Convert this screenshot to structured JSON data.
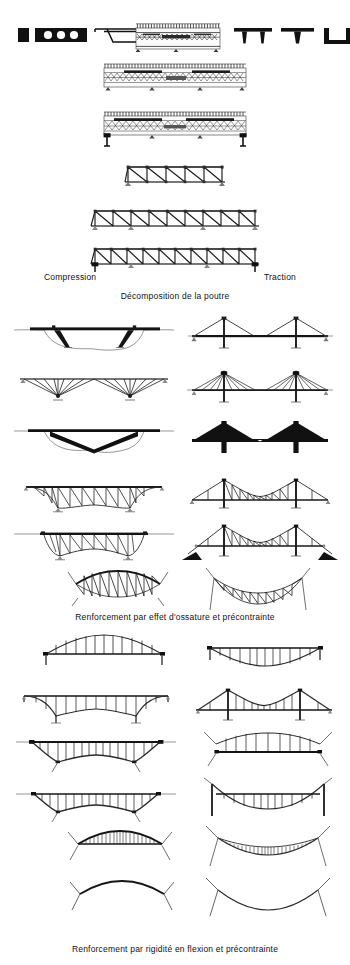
{
  "plate": {
    "title_captions": {
      "compression": "Compression",
      "traction": "Traction",
      "decomposition": "Décomposition de la poutre",
      "reinforcement_frame": "Renforcement par effet d'ossature et précontrainte",
      "reinforcement_stiffness": "Renforcement par rigidité en flexion et précontrainte"
    },
    "ink": {
      "solid": "#111111",
      "line": "#1c1c1c",
      "hairline": "#555555",
      "grey": "#7a7a7a",
      "paper": "#ffffff"
    },
    "rows": [
      {
        "id": "cross-sections",
        "label": "Sections transversales",
        "items": [
          {
            "name": "solid-rectangular-section",
            "fill": "solid"
          },
          {
            "name": "voided-slab-section",
            "voids": 3,
            "fill": "solid"
          },
          {
            "name": "box-girder-trapezoid-section",
            "fill": "outline"
          },
          {
            "name": "reinforced-concrete-slab-section",
            "fill": "hatched"
          },
          {
            "name": "double-tee-section",
            "fill": "solid"
          },
          {
            "name": "single-tee-section",
            "fill": "solid"
          },
          {
            "name": "u-channel-section",
            "fill": "solid"
          }
        ]
      },
      {
        "id": "concrete-beam-elevations",
        "label": "Poutres en béton — trajectoires d'efforts",
        "items": [
          {
            "name": "concrete-beam-two-span",
            "supports": 4
          },
          {
            "name": "concrete-beam-cantilever",
            "supports": 4
          }
        ]
      },
      {
        "id": "truss-beams",
        "label": "Poutres en treillis",
        "items": [
          {
            "name": "warren-truss-short",
            "bays": 5
          },
          {
            "name": "warren-truss-medium",
            "bays": 9
          },
          {
            "name": "warren-truss-long",
            "bays": 10
          }
        ]
      },
      {
        "id": "decomposition",
        "label": "Décomposition de la poutre",
        "pairs": [
          {
            "left": "strutted-beam-over-valley",
            "right": "cable-stayed-two-tower-harp"
          },
          {
            "left": "fan-strut-beam",
            "right": "cable-stayed-two-tower-fan"
          },
          {
            "left": "solid-cantilever-silhouette",
            "right": "cable-stayed-silhouette-solid"
          },
          {
            "left": "truss-stiffened-arch-beam",
            "right": "suspension-truss-deck"
          },
          {
            "left": "bowstring-truss-beam",
            "right": "suspension-truss-anchored"
          }
        ]
      },
      {
        "id": "frame-effect",
        "label": "Renforcement par effet d'ossature et précontrainte",
        "pairs": [
          {
            "left": "lens-truss-arch",
            "right": "lens-truss-sag"
          }
        ]
      },
      {
        "id": "stiffness-effect",
        "label": "Renforcement par rigidité en flexion et précontrainte",
        "pairs": [
          {
            "left": "arch-with-spandrel-posts",
            "right": "suspension-with-hangers-shallow"
          },
          {
            "left": "arch-tied-spandrel",
            "right": "suspension-two-tower-hangers"
          },
          {
            "left": "arch-deck-above-posts",
            "right": "suspension-catenary-hangers"
          },
          {
            "left": "arch-low-rise-posts",
            "right": "suspension-deep-sag-hangers"
          },
          {
            "left": "arch-full-infill-posts",
            "right": "suspension-full-infill-hangers"
          },
          {
            "left": "bare-arch-rib",
            "right": "bare-suspension-cable"
          }
        ]
      }
    ]
  }
}
